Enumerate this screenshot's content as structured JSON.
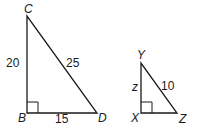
{
  "figure": {
    "triangle_1": {
      "vertices": {
        "C": "C",
        "B": "B",
        "D": "D"
      },
      "sides": {
        "CB": "20",
        "CD": "25",
        "BD": "15"
      },
      "right_angle_at": "B"
    },
    "triangle_2": {
      "vertices": {
        "Y": "Y",
        "X": "X",
        "Z": "Z"
      },
      "sides": {
        "YX": "z",
        "YZ": "10"
      },
      "right_angle_at": "X"
    },
    "stroke_color": "#1a1a1a"
  }
}
